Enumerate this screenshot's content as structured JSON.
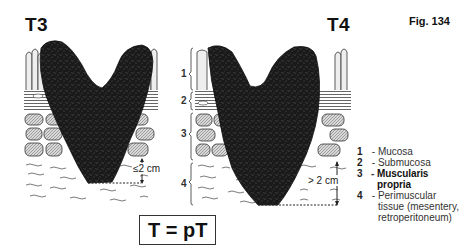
{
  "figure": {
    "label": "Fig. 134",
    "formula": "T = pT"
  },
  "panels": [
    {
      "title": "T3",
      "measurement": "≤2 cm"
    },
    {
      "title": "T4",
      "measurement": "> 2 cm",
      "layer_numbers": [
        "1",
        "2",
        "3",
        "4"
      ]
    }
  ],
  "legend": {
    "items": [
      {
        "num": "1",
        "sep": " - ",
        "label": "Mucosa"
      },
      {
        "num": "2",
        "sep": " - ",
        "label": "Submucosa"
      },
      {
        "num": "3",
        "sep": " - ",
        "label": "Muscularis propria"
      },
      {
        "num": "4",
        "sep": " - ",
        "label": "Perimuscular",
        "label2": "tissue (mesentery,",
        "label3": "retroperitoneum)"
      }
    ]
  },
  "colors": {
    "tumor": "#1a1a1a",
    "muscle_fill": "#bdbdbd",
    "ink": "#222222"
  }
}
